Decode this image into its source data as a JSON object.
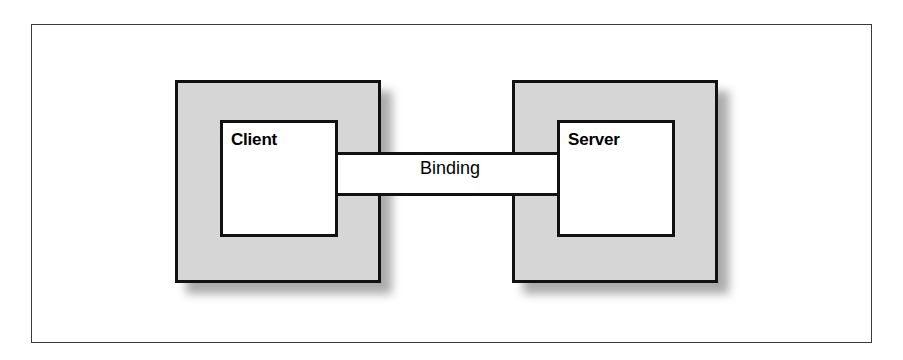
{
  "figure": {
    "frame": {
      "visible": true,
      "border_color": "#3a3a3a"
    },
    "colors": {
      "process_fill": "#d6d6d6",
      "interface_fill": "#ffffff",
      "outline": "#111111",
      "shadow": "#9d9d9d",
      "text": "#000000",
      "background": "#ffffff"
    }
  },
  "diagram": {
    "type": "block-diagram",
    "nodes": [
      {
        "id": "client",
        "label": "Client",
        "role": "process"
      },
      {
        "id": "server",
        "label": "Server",
        "role": "process"
      }
    ],
    "connector": {
      "id": "binding",
      "label": "Binding",
      "from": "client",
      "to": "server",
      "style": "channel"
    }
  }
}
